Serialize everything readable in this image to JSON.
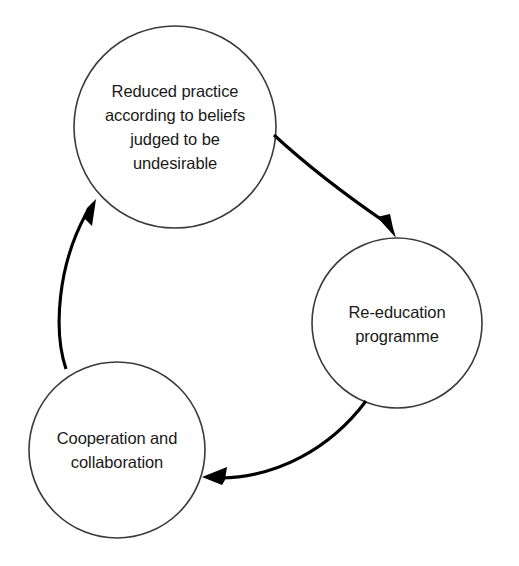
{
  "diagram": {
    "type": "cycle-diagram",
    "title": "",
    "background_color": "#ffffff",
    "circle_stroke_color": "#3a3a3c",
    "arrow_color": "#000000",
    "text_color": "#1a1a1a",
    "direction": "clockwise",
    "nodes": [
      {
        "id": "reduced-practice",
        "label": "Reduced practice\naccording to beliefs\njudged to be\nundesirable",
        "position": "top",
        "cx": 175,
        "cy": 127,
        "r": 101
      },
      {
        "id": "re-education",
        "label": "Re-education\nprogramme",
        "position": "right",
        "cx": 397,
        "cy": 323,
        "r": 85
      },
      {
        "id": "cooperation",
        "label": "Cooperation and\ncollaboration",
        "position": "bottom-left",
        "cx": 117,
        "cy": 450,
        "r": 88
      }
    ],
    "edges": [
      {
        "id": "edge-reduced-to-reeducation",
        "from": "reduced-practice",
        "to": "re-education",
        "label": ""
      },
      {
        "id": "edge-reeducation-to-cooperation",
        "from": "re-education",
        "to": "cooperation",
        "label": ""
      },
      {
        "id": "edge-cooperation-to-reduced",
        "from": "cooperation",
        "to": "reduced-practice",
        "label": ""
      }
    ]
  }
}
